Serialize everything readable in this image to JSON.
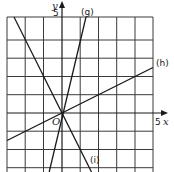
{
  "graph": {
    "axes": {
      "x_label": "x",
      "y_label": "y",
      "x_tick_label": "5",
      "y_tick_label": "5",
      "origin_label": "O",
      "x_range": [
        -3,
        5
      ],
      "y_range": [
        -3.25,
        5.25
      ],
      "grid": true
    },
    "lines": [
      {
        "label": "(g)",
        "slope": 4,
        "intercept": 0
      },
      {
        "label": "(h)",
        "slope": 0.5,
        "intercept": 0
      },
      {
        "label": "(i)",
        "slope": -2,
        "intercept": 0
      }
    ]
  }
}
